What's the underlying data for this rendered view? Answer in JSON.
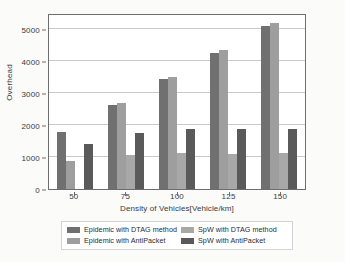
{
  "chart_data": {
    "type": "bar",
    "title": "",
    "xlabel": "Density of Vehicles[Vehicle/km]",
    "ylabel": "Overhead",
    "categories": [
      "50",
      "75",
      "100",
      "125",
      "150"
    ],
    "ylim": [
      0,
      5500
    ],
    "yticks": [
      0,
      1000,
      2000,
      3000,
      4000,
      5000
    ],
    "ytick_labels": [
      "0",
      "1000",
      "2000",
      "3000",
      "4000",
      "5000"
    ],
    "grid": true,
    "legend_position": "below-axes",
    "series": [
      {
        "name": "Epidemic with DTAG method",
        "color": "#707070",
        "values": [
          1780,
          2620,
          3440,
          4260,
          5080
        ]
      },
      {
        "name": "Epidemic with AntiPacket",
        "color": "#9e9e9e",
        "values": [
          870,
          2700,
          3500,
          4340,
          5200
        ]
      },
      {
        "name": "SpW with DTAG method",
        "color": "#a8a8a8",
        "values": [
          0,
          1050,
          1130,
          1090,
          1120
        ]
      },
      {
        "name": "SpW with AntiPacket",
        "color": "#5a5a5a",
        "values": [
          1400,
          1740,
          1880,
          1880,
          1880
        ]
      }
    ]
  },
  "legend": {
    "entries": [
      {
        "label": "Epidemic with DTAG method",
        "color": "#707070"
      },
      {
        "label": "SpW with DTAG method",
        "color": "#a8a8a8"
      },
      {
        "label": "Epidemic with AntiPacket",
        "color": "#9e9e9e"
      },
      {
        "label": "SpW with AntiPacket",
        "color": "#5a5a5a"
      }
    ]
  },
  "colors": {
    "axis": "#6d6d6d",
    "grid": "#c9c9c9",
    "background": "#fbfbfa",
    "plot_background": "#ffffff",
    "text": "#2b2b2b"
  }
}
